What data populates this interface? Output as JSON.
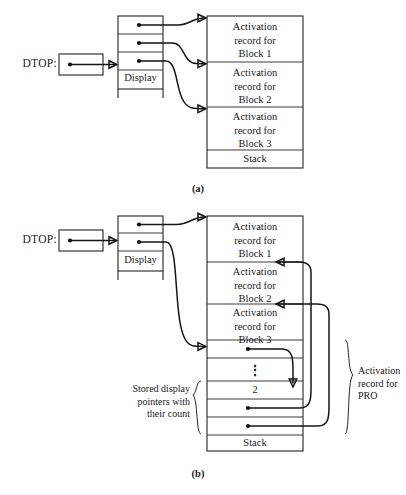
{
  "figure": {
    "title_a_caption": "(a)",
    "title_b_caption": "(b)"
  },
  "panel_a": {
    "dtop_label": "DTOP:",
    "display_label": "Display",
    "display_cells": [
      {
        "id": "a-display-0",
        "content": ""
      },
      {
        "id": "a-display-1",
        "content": ""
      },
      {
        "id": "a-display-2",
        "content": ""
      }
    ],
    "stack_label": "Stack",
    "stack_cells": [
      {
        "id": "a-stack-0",
        "line1": "Activation",
        "line2": "record for",
        "line3": "Block 1"
      },
      {
        "id": "a-stack-1",
        "line1": "Activation",
        "line2": "record for",
        "line3": "Block 2"
      },
      {
        "id": "a-stack-2",
        "line1": "Activation",
        "line2": "record for",
        "line3": "Block 3"
      }
    ]
  },
  "panel_b": {
    "dtop_label": "DTOP:",
    "display_label": "Display",
    "display_cells": [
      {
        "id": "b-display-0",
        "content": ""
      },
      {
        "id": "b-display-1",
        "content": ""
      }
    ],
    "stack_label": "Stack",
    "stack_cells": [
      {
        "id": "b-stack-0",
        "line1": "Activation",
        "line2": "record for",
        "line3": "Block 1"
      },
      {
        "id": "b-stack-1",
        "line1": "Activation",
        "line2": "record for",
        "line3": "Block 2"
      },
      {
        "id": "b-stack-2",
        "line1": "Activation",
        "line2": "record for",
        "line3": "Block 3"
      }
    ],
    "saved_pointer_cell": "",
    "ellipsis_cell": "⋮",
    "count_cell": "2",
    "saved_pointer_cell_2": "",
    "saved_pointer_cell_3": "",
    "stored_display_note": {
      "line1": "Stored display",
      "line2": "pointers with",
      "line3": "their count"
    },
    "activation_record_pro": {
      "line1": "Activation",
      "line2": "record for",
      "line3": "PRO"
    }
  },
  "colors": {
    "stroke": "#242424",
    "connector": "#141414",
    "background": "#ffffff"
  }
}
